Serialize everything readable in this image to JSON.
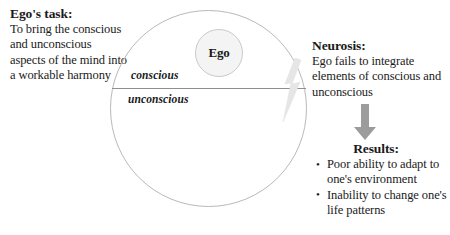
{
  "ego_task": {
    "heading": "Ego's task:",
    "body": "To bring the conscious and unconscious aspects of the mind into a workable harmony"
  },
  "psyche": {
    "ego_label": "Ego",
    "conscious_label": "conscious",
    "unconscious_label": "unconscious",
    "circle_stroke": "#b9b9b9",
    "divider_color": "#8f8f93",
    "ego_fill": "#f4f4f4",
    "bolt_color": "#e2e2e2"
  },
  "neurosis": {
    "heading": "Neurosis:",
    "body": "Ego fails to integrate elements of conscious and unconscious"
  },
  "arrow": {
    "color": "#9a9a9a"
  },
  "results": {
    "heading": "Results:",
    "items": [
      "Poor ability to adapt to one's environment",
      "Inability to change one's life patterns"
    ]
  }
}
